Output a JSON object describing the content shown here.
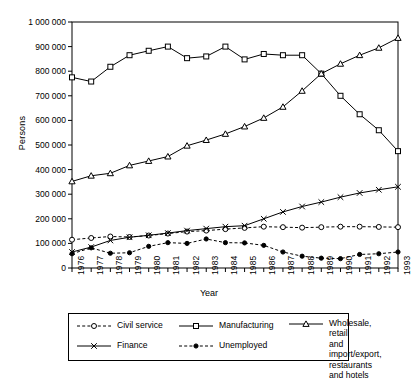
{
  "chart_data": {
    "type": "line",
    "title": "",
    "xlabel": "Year",
    "ylabel": "Persons",
    "xlim": [
      1976,
      1993
    ],
    "ylim": [
      0,
      1000000
    ],
    "grid": false,
    "legend_position": "bottom",
    "x": [
      1976,
      1977,
      1978,
      1979,
      1980,
      1981,
      1982,
      1983,
      1984,
      1985,
      1986,
      1987,
      1988,
      1989,
      1990,
      1991,
      1992,
      1993
    ],
    "xtick_labels": [
      "1976",
      "1977",
      "1978",
      "1979",
      "1980",
      "1981",
      "1982",
      "1983",
      "1984",
      "1985",
      "1986",
      "1987",
      "1988",
      "1989",
      "1990",
      "1991",
      "1992",
      "1993"
    ],
    "ytick_labels": [
      "0",
      "100 000",
      "200 000",
      "300 000",
      "400 000",
      "500 000",
      "600 000",
      "700 000",
      "800 000",
      "900 000",
      "1 000 000"
    ],
    "ytick_values": [
      0,
      100000,
      200000,
      300000,
      400000,
      500000,
      600000,
      700000,
      800000,
      900000,
      1000000
    ],
    "series": [
      {
        "name": "Civil service",
        "marker": "open-circle",
        "line": "dashed",
        "values": [
          115000,
          122000,
          128000,
          126000,
          132000,
          140000,
          148000,
          152000,
          158000,
          163000,
          168000,
          166000,
          164000,
          166000,
          168000,
          168000,
          167000,
          166000
        ]
      },
      {
        "name": "Manufacturing",
        "marker": "open-square",
        "line": "solid",
        "values": [
          775000,
          758000,
          818000,
          865000,
          883000,
          900000,
          853000,
          860000,
          900000,
          848000,
          870000,
          865000,
          865000,
          790000,
          700000,
          625000,
          560000,
          475000
        ]
      },
      {
        "name": "Wholesale, retail\nand import/export,\nrestaurants and hotels",
        "marker": "open-triangle",
        "line": "solid",
        "values": [
          352000,
          375000,
          385000,
          417000,
          435000,
          453000,
          497000,
          520000,
          545000,
          575000,
          610000,
          655000,
          720000,
          790000,
          830000,
          865000,
          895000,
          935000
        ]
      },
      {
        "name": "Finance",
        "marker": "cross-x",
        "line": "solid",
        "values": [
          65000,
          85000,
          112000,
          125000,
          133000,
          142000,
          152000,
          160000,
          168000,
          172000,
          200000,
          228000,
          250000,
          268000,
          288000,
          305000,
          318000,
          330000
        ]
      },
      {
        "name": "Unemployed",
        "marker": "filled-circle",
        "line": "dashed",
        "values": [
          58000,
          82000,
          60000,
          62000,
          88000,
          103000,
          100000,
          118000,
          103000,
          102000,
          92000,
          65000,
          48000,
          40000,
          38000,
          55000,
          58000,
          65000
        ]
      }
    ]
  },
  "legend": {
    "items": [
      {
        "label": "Civil service",
        "marker": "open-circle",
        "line": "dashed"
      },
      {
        "label": "Manufacturing",
        "marker": "open-square",
        "line": "solid"
      },
      {
        "label": "Wholesale, retail\nand import/export,\nrestaurants and hotels",
        "marker": "open-triangle",
        "line": "solid"
      },
      {
        "label": "Finance",
        "marker": "cross-x",
        "line": "solid"
      },
      {
        "label": "Unemployed",
        "marker": "filled-circle",
        "line": "dashed"
      }
    ]
  },
  "colors": {
    "line": "#000000",
    "axis": "#000000",
    "background": "#ffffff"
  }
}
